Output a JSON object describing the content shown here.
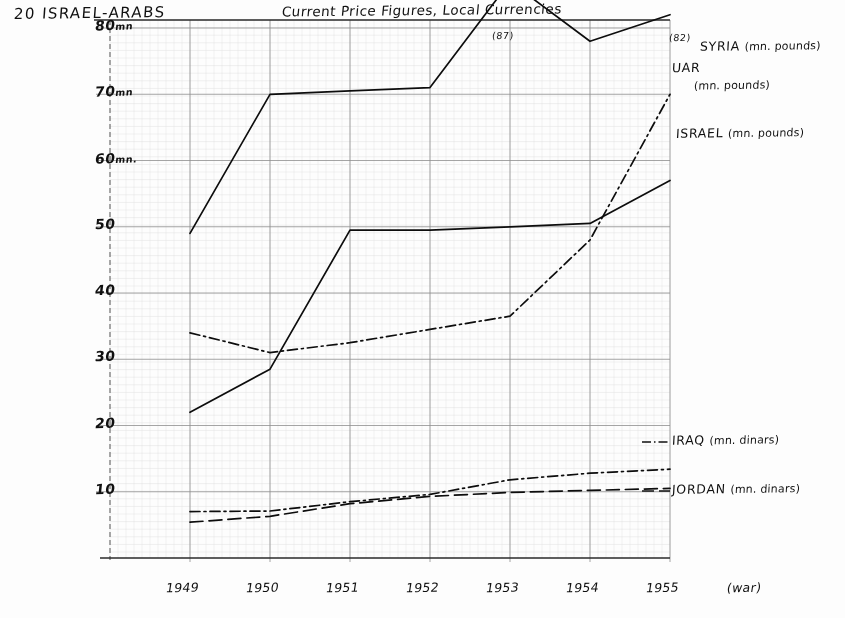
{
  "page": {
    "folio_label": "20 ISRAEL-ARABS",
    "chart_title": "Current Price Figures, Local Currencies",
    "war_note": "(war)"
  },
  "chart_data": {
    "type": "line",
    "title": "Current Price Figures, Local Currencies",
    "xlabel": "",
    "ylabel": "",
    "grid": true,
    "legend_position": "right-inline",
    "categories": [
      "1949",
      "1950",
      "1951",
      "1952",
      "1953",
      "1954",
      "1955"
    ],
    "x": [
      1949,
      1950,
      1951,
      1952,
      1953,
      1954,
      1955
    ],
    "ylim": [
      0,
      82
    ],
    "yticks": [
      10,
      20,
      30,
      40,
      50,
      60,
      70,
      80
    ],
    "ytick_labels": [
      "10",
      "20",
      "30",
      "40",
      "50",
      "60",
      "70",
      "80"
    ],
    "y_units": {
      "80": "mn",
      "70": "mn",
      "60": "mn."
    },
    "annotations": [
      {
        "text": "(87)",
        "x": 1953,
        "y": 87,
        "note": "peak above plot area"
      },
      {
        "text": "(82)",
        "x": 1955,
        "y": 82,
        "note": "end value above plot area"
      }
    ],
    "series": [
      {
        "name": "SYRIA",
        "unit": "(mn. pounds)",
        "style": "solid",
        "values": [
          49,
          70,
          70.5,
          71,
          87,
          78,
          82
        ]
      },
      {
        "name": "UAR",
        "unit": "(mn. pounds)",
        "style": "dash-dot",
        "values": [
          34,
          31,
          32.5,
          34.5,
          36.5,
          48,
          70
        ]
      },
      {
        "name": "ISRAEL",
        "unit": "(mn. pounds)",
        "style": "solid",
        "values": [
          22,
          28.5,
          49.5,
          49.5,
          50,
          50.5,
          57
        ]
      },
      {
        "name": "IRAQ",
        "unit": "(mn. dinars)",
        "style": "dash-dot",
        "values": [
          7,
          7.1,
          8.5,
          9.6,
          11.8,
          12.8,
          13.4
        ]
      },
      {
        "name": "JORDAN",
        "unit": "(mn. dinars)",
        "style": "dashed",
        "values": [
          5.4,
          6.3,
          8.2,
          9.3,
          9.9,
          10.2,
          10.5
        ]
      }
    ]
  },
  "axis": {
    "y_labels": [
      {
        "value": "80",
        "unit": "mn"
      },
      {
        "value": "70",
        "unit": "mn"
      },
      {
        "value": "60",
        "unit": "mn."
      },
      {
        "value": "50",
        "unit": ""
      },
      {
        "value": "40",
        "unit": ""
      },
      {
        "value": "30",
        "unit": ""
      },
      {
        "value": "20",
        "unit": ""
      },
      {
        "value": "10",
        "unit": ""
      }
    ],
    "x_labels": [
      "1949",
      "1950",
      "1951",
      "1952",
      "1953",
      "1954",
      "1955"
    ]
  },
  "series_labels": [
    {
      "name": "SYRIA",
      "unit": "(mn. pounds)"
    },
    {
      "name": "UAR",
      "unit": "(mn. pounds)"
    },
    {
      "name": "ISRAEL",
      "unit": "(mn. pounds)"
    },
    {
      "name": "IRAQ",
      "unit": "(mn. dinars)"
    },
    {
      "name": "JORDAN",
      "unit": "(mn. dinars)"
    }
  ]
}
